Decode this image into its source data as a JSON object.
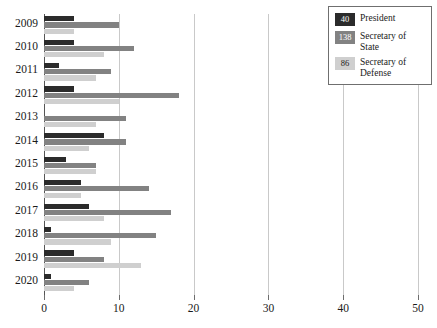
{
  "chart_data": {
    "type": "bar",
    "orientation": "horizontal",
    "title": "",
    "xlabel": "",
    "ylabel": "",
    "xlim": [
      0,
      50
    ],
    "xticks": [
      0,
      10,
      20,
      30,
      40,
      50
    ],
    "xtick_labels": [
      "0",
      "10",
      "20",
      "30",
      "40",
      "50"
    ],
    "grid": true,
    "grid_axis": "x",
    "legend_position": "top-right",
    "categories": [
      "2009",
      "2010",
      "2011",
      "2012",
      "2013",
      "2014",
      "2015",
      "2016",
      "2017",
      "2018",
      "2019",
      "2020"
    ],
    "series": [
      {
        "name": "President",
        "total": 40,
        "color": "#2b2b2b",
        "values": [
          4,
          4,
          2,
          4,
          0,
          8,
          3,
          5,
          6,
          1,
          4,
          1
        ]
      },
      {
        "name": "Secretary of State",
        "total": 138,
        "color": "#828282",
        "values": [
          10,
          12,
          9,
          18,
          11,
          11,
          7,
          14,
          17,
          15,
          8,
          6
        ]
      },
      {
        "name": "Secretary of Defense",
        "total": 86,
        "color": "#cfcfcf",
        "values": [
          4,
          8,
          7,
          10,
          7,
          6,
          7,
          5,
          8,
          9,
          13,
          4
        ]
      }
    ]
  },
  "legend": {
    "items": [
      {
        "value": "40",
        "label": "President",
        "swatch_class": "president"
      },
      {
        "value": "138",
        "label": "Secretary of State",
        "swatch_class": "state"
      },
      {
        "value": "86",
        "label": "Secretary of Defense",
        "swatch_class": "defense"
      }
    ]
  }
}
